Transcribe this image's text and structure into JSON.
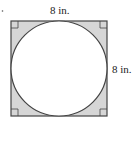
{
  "diagram": {
    "top_label": "8 in.",
    "right_label": "8 in.",
    "colors": {
      "fill": "#d6d6d6",
      "stroke": "#444444",
      "circle_fill": "#ffffff"
    }
  }
}
